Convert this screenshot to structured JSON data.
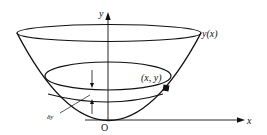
{
  "figure": {
    "type": "paraboloid-bowl-diagram",
    "axes": {
      "y_label": "y",
      "x_label": "x",
      "origin_label": "O"
    },
    "curve_label": "y(x)",
    "point_label": "(x, y)",
    "slice_thickness_label": "δy",
    "colors": {
      "stroke": "#111111",
      "background": "#ffffff"
    }
  }
}
